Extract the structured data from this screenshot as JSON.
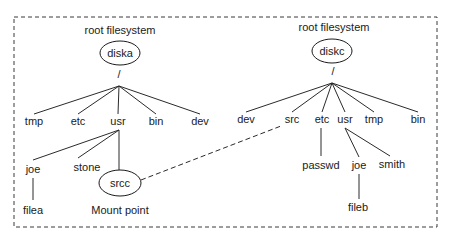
{
  "diagram": {
    "frame": {
      "x": 14,
      "y": 17,
      "width": 423,
      "height": 210,
      "style": "dashed"
    },
    "colors": {
      "stroke": "#2a2a2a",
      "text": "#1a1a1a",
      "background": "#ffffff"
    },
    "filesystems": [
      {
        "id": "diska",
        "caption": "root filesystem",
        "caption_pos": [
          120,
          31
        ],
        "disk": {
          "label": "diska",
          "cx": 120,
          "cy": 53,
          "rx": 20,
          "ry": 12
        },
        "root": {
          "label": "/",
          "x": 119,
          "y": 75
        },
        "apex": [
          119,
          86
        ],
        "children_y": 122,
        "children": [
          {
            "label": "tmp",
            "x": 34
          },
          {
            "label": "etc",
            "x": 78
          },
          {
            "label": "usr",
            "x": 118
          },
          {
            "label": "bin",
            "x": 156
          },
          {
            "label": "dev",
            "x": 200
          }
        ],
        "subtrees": [
          {
            "parent": "usr",
            "apex": [
              119,
              130
            ],
            "nodes": [
              {
                "label": "joe",
                "x": 33,
                "y": 170,
                "edge_to": [
                  33,
                  160
                ]
              },
              {
                "label": "stone",
                "x": 87,
                "y": 168,
                "edge_to": [
                  78,
                  158
                ]
              }
            ]
          },
          {
            "parent": "joe",
            "apex": [
              33,
              178
            ],
            "nodes": [
              {
                "label": "filea",
                "x": 33,
                "y": 211,
                "edge_to": [
                  33,
                  200
                ]
              }
            ]
          }
        ],
        "mount_point": {
          "label": "srcc",
          "cx": 120,
          "cy": 183,
          "rx": 21,
          "ry": 13,
          "edge_from": [
            119,
            130
          ],
          "caption": "Mount point",
          "caption_pos": [
            120,
            211
          ]
        }
      },
      {
        "id": "diskc",
        "caption": "root filesystem",
        "caption_pos": [
          334,
          28
        ],
        "disk": {
          "label": "diskc",
          "cx": 332,
          "cy": 51,
          "rx": 20,
          "ry": 12
        },
        "root": {
          "label": "/",
          "x": 333,
          "y": 72
        },
        "apex": [
          332,
          83
        ],
        "children_y": 120,
        "children": [
          {
            "label": "dev",
            "x": 246
          },
          {
            "label": "src",
            "x": 292
          },
          {
            "label": "etc",
            "x": 322
          },
          {
            "label": "usr",
            "x": 345
          },
          {
            "label": "tmp",
            "x": 374
          },
          {
            "label": "bin",
            "x": 418
          }
        ],
        "subtrees": [
          {
            "parent": "etc",
            "apex": [
              321,
              128
            ],
            "nodes": [
              {
                "label": "passwd",
                "x": 321,
                "y": 166,
                "edge_to": [
                  321,
                  156
                ]
              }
            ]
          },
          {
            "parent": "usr",
            "apex": [
              345,
              128
            ],
            "nodes": [
              {
                "label": "joe",
                "x": 359,
                "y": 166,
                "edge_to": [
                  359,
                  157
                ]
              },
              {
                "label": "smith",
                "x": 392,
                "y": 165,
                "edge_to": [
                  390,
                  156
                ]
              }
            ]
          },
          {
            "parent": "joe",
            "apex": [
              359,
              174
            ],
            "nodes": [
              {
                "label": "fileb",
                "x": 358,
                "y": 208,
                "edge_to": [
                  359,
                  199
                ]
              }
            ]
          }
        ]
      }
    ],
    "mount_link": {
      "from": "srcc",
      "to": "src",
      "x1": 141,
      "y1": 180,
      "x2": 281,
      "y2": 126,
      "style": "dashed"
    }
  }
}
